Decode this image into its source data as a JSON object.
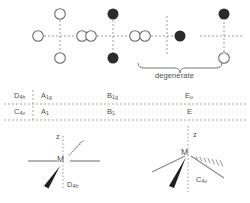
{
  "figure": {
    "title_present": false,
    "brace_label": "degenerate",
    "atom_legend": {
      "open_circle": "ligand atom (positive / no phase)",
      "filled_circle": "ligand atom (negative / opposite phase)"
    }
  },
  "vibration_diagrams": [
    {
      "id": "a1g",
      "name": "symmetric-stretch-a1g",
      "circles": [
        {
          "pos": "left",
          "fill": "open"
        },
        {
          "pos": "right",
          "fill": "open"
        },
        {
          "pos": "top",
          "fill": "open"
        },
        {
          "pos": "bottom",
          "fill": "open"
        }
      ]
    },
    {
      "id": "b1g",
      "name": "asymmetric-stretch-b1g",
      "circles": [
        {
          "pos": "left",
          "fill": "open"
        },
        {
          "pos": "right",
          "fill": "open"
        },
        {
          "pos": "top",
          "fill": "filled"
        },
        {
          "pos": "bottom",
          "fill": "filled"
        }
      ]
    },
    {
      "id": "eu-x",
      "name": "degenerate-stretch-eu-x",
      "circles": [
        {
          "pos": "left",
          "fill": "open"
        },
        {
          "pos": "right",
          "fill": "filled"
        }
      ]
    },
    {
      "id": "eu-y",
      "name": "degenerate-stretch-eu-y",
      "circles": [
        {
          "pos": "top",
          "fill": "filled"
        },
        {
          "pos": "bottom",
          "fill": "open"
        }
      ]
    }
  ],
  "symmetry_table": {
    "rows": [
      {
        "point_group": "D",
        "point_group_sub": "4h",
        "labels": [
          {
            "main": "A",
            "sub": "1g"
          },
          {
            "main": "B",
            "sub": "1g"
          },
          {
            "main": "E",
            "sub": "u"
          }
        ]
      },
      {
        "point_group": "C",
        "point_group_sub": "4v",
        "labels": [
          {
            "main": "A",
            "sub": "1"
          },
          {
            "main": "B",
            "sub": "1"
          },
          {
            "main": "E",
            "sub": ""
          }
        ]
      }
    ]
  },
  "structures": [
    {
      "id": "d4h",
      "name": "square-planar-structure",
      "metal_label": "M",
      "axis_label": "z",
      "point_group": "D",
      "point_group_sub": "4h",
      "geometry": "square planar"
    },
    {
      "id": "c4v",
      "name": "square-pyramidal-structure",
      "metal_label": "M",
      "axis_label": "z",
      "point_group": "C",
      "point_group_sub": "4v",
      "geometry": "square pyramidal"
    }
  ],
  "colors": {
    "open_circle_stroke": "#6e6e6e",
    "filled_circle": "#2b2b2b",
    "dash_line": "#9b9b9b",
    "solid_line": "#8a8a8a",
    "text": "#4f4f4f",
    "background": "#ffffff"
  }
}
